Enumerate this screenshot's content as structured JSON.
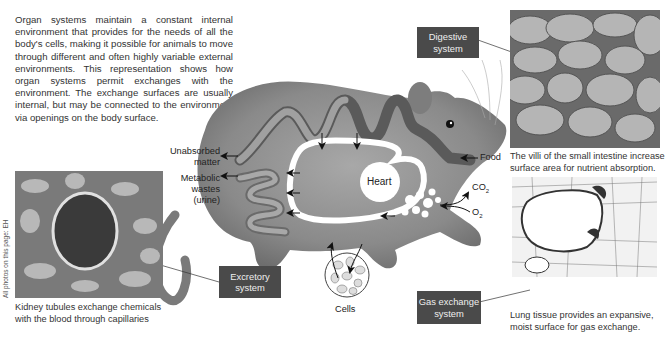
{
  "intro": {
    "text": "Organ systems maintain a constant internal environment that provides for the needs of all the body's cells, making it possible for animals to move through different and often highly variable external environments. This representation shows how organ systems permit exchanges with the environment. The exchange surfaces are usually internal, but may be connected to the environment via openings on the body surface."
  },
  "labels": {
    "unabsorbed_1": "Unabsorbed",
    "unabsorbed_2": "matter",
    "metabolic_1": "Metabolic",
    "metabolic_2": "wastes",
    "metabolic_3": "(urine)",
    "food": "Food",
    "heart": "Heart",
    "co2": "CO",
    "co2_sub": "2",
    "o2": "O",
    "o2_sub": "2",
    "cells": "Cells"
  },
  "boxes": {
    "digestive_1": "Digestive",
    "digestive_2": "system",
    "excretory_1": "Excretory",
    "excretory_2": "system",
    "gas_1": "Gas exchange",
    "gas_2": "system"
  },
  "captions": {
    "villi_1": "The villi of the small intestine increase",
    "villi_2": "surface area for nutrient absorption.",
    "kidney_1": "Kidney tubules exchange chemicals",
    "kidney_2": "with the blood through capillaries",
    "lung_1": "Lung tissue provides an expansive,",
    "lung_2": "moist surface for gas exchange."
  },
  "credit": "All photos on this page: EH",
  "colors": {
    "box_bg": "#4a4a4a",
    "gut_dark": "#555555",
    "gut_light": "#9a9a9a",
    "rat_fur": "#8e8e8e",
    "white_loop": "#ffffff"
  }
}
